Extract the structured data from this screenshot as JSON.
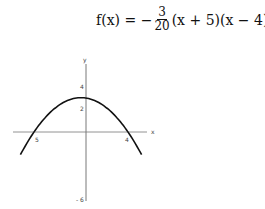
{
  "formula": {
    "lhs": "f(x) = −",
    "frac_num": "3",
    "frac_den": "20",
    "rhs": "(x + 5)(x − 4)."
  },
  "chart_data": {
    "type": "line",
    "xlabel": "x",
    "ylabel": "y",
    "x_ticks": [
      "-5",
      "4"
    ],
    "y_ticks": [
      "4",
      "2",
      "-6"
    ],
    "tick_labels": {
      "x_neg5": "5",
      "x_4": "4",
      "y_4": "4",
      "y_2": "2",
      "y_neg6": "- 6"
    },
    "series": [
      {
        "name": "f(x)",
        "function": "-3/20*(x+5)*(x-4)",
        "x_range": [
          -6.3,
          5.3
        ],
        "vertex": [
          -0.5,
          3.04
        ],
        "roots": [
          -5,
          4
        ],
        "y_intercept": 3
      }
    ],
    "xlim": [
      -6.5,
      6
    ],
    "ylim": [
      -6,
      6
    ],
    "grid": false,
    "curve_color": "#111111",
    "axis_color": "#555555"
  }
}
